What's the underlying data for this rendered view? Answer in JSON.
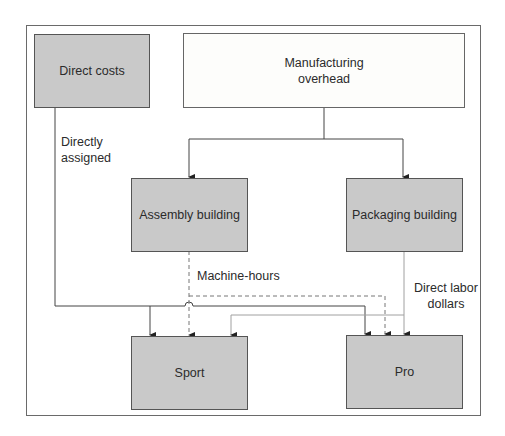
{
  "diagram": {
    "boxes": {
      "direct_costs": "Direct costs",
      "manufacturing_overhead": "Manufacturing overhead",
      "assembly_building": "Assembly building",
      "packaging_building": "Packaging building",
      "sport": "Sport",
      "pro": "Pro"
    },
    "labels": {
      "directly_assigned": "Directly assigned",
      "machine_hours": "Machine-hours",
      "direct_labor_dollars": "Direct labor dollars"
    },
    "colors": {
      "box_fill": "#c9c9c9",
      "overhead_fill": "#fdfdfb",
      "border": "#555555",
      "direct_cost_line": "#444444",
      "machine_hours_line": "#777777",
      "direct_labor_line": "#9a9a9a"
    }
  }
}
